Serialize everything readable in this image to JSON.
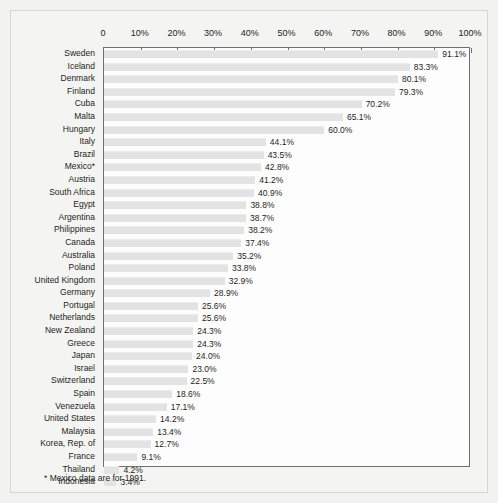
{
  "chart_data": {
    "type": "bar",
    "orientation": "horizontal",
    "title": "",
    "xlabel": "",
    "ylabel": "",
    "xlim": [
      0,
      100
    ],
    "xticks": [
      "0",
      "10%",
      "20%",
      "30%",
      "40%",
      "50%",
      "60%",
      "70%",
      "80%",
      "90%",
      "100%"
    ],
    "xtick_values": [
      0,
      10,
      20,
      30,
      40,
      50,
      60,
      70,
      80,
      90,
      100
    ],
    "grid": false,
    "legend": null,
    "categories": [
      "Sweden",
      "Iceland",
      "Denmark",
      "Finland",
      "Cuba",
      "Malta",
      "Hungary",
      "Italy",
      "Brazil",
      "Mexico*",
      "Austria",
      "South Africa",
      "Egypt",
      "Argentina",
      "Philippines",
      "Canada",
      "Australia",
      "Poland",
      "United Kingdom",
      "Germany",
      "Portugal",
      "Netherlands",
      "New Zealand",
      "Greece",
      "Japan",
      "Israel",
      "Switzerland",
      "Spain",
      "Venezuela",
      "United States",
      "Malaysia",
      "Korea, Rep. of",
      "France",
      "Thailand",
      "Indonesia"
    ],
    "values": [
      91.1,
      83.3,
      80.1,
      79.3,
      70.2,
      65.1,
      60.0,
      44.1,
      43.5,
      42.8,
      41.2,
      40.9,
      38.8,
      38.7,
      38.2,
      37.4,
      35.2,
      33.8,
      32.9,
      28.9,
      25.6,
      25.6,
      24.3,
      24.3,
      24.0,
      23.0,
      22.5,
      18.6,
      17.1,
      14.2,
      13.4,
      12.7,
      9.1,
      4.2,
      3.4
    ],
    "value_labels": [
      "91.1%",
      "83.3%",
      "80.1%",
      "79.3%",
      "70.2%",
      "65.1%",
      "60.0%",
      "44.1%",
      "43.5%",
      "42.8%",
      "41.2%",
      "40.9%",
      "38.8%",
      "38.7%",
      "38.2%",
      "37.4%",
      "35.2%",
      "33.8%",
      "32.9%",
      "28.9%",
      "25.6%",
      "25.6%",
      "24.3%",
      "24.3%",
      "24.0%",
      "23.0%",
      "22.5%",
      "18.6%",
      "17.1%",
      "14.2%",
      "13.4%",
      "12.7%",
      "9.1%",
      "4.2%",
      "3.4%"
    ],
    "bar_color": "#e3e3e3",
    "plot_border_color": "#6f6f6f",
    "text_color": "#231f20"
  },
  "footnote": "* Mexico data are for 1991."
}
